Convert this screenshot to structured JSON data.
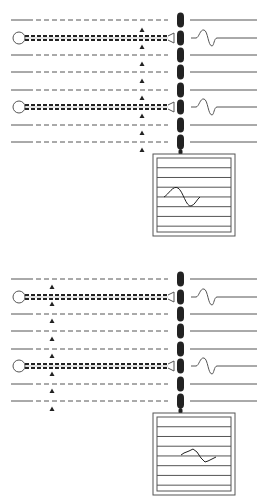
{
  "diagram": {
    "panels": [
      {
        "id": "top",
        "offset_y": 0,
        "arrow_x": 142,
        "rows": [
          {
            "y": 20,
            "type": "dashed",
            "wave": false
          },
          {
            "y": 38,
            "type": "electrode",
            "wave": true
          },
          {
            "y": 55,
            "type": "dashed",
            "wave": false
          },
          {
            "y": 72,
            "type": "dashed",
            "wave": false
          },
          {
            "y": 90,
            "type": "dashed",
            "wave": false
          },
          {
            "y": 107,
            "type": "electrode",
            "wave": true
          },
          {
            "y": 125,
            "type": "dashed",
            "wave": false
          },
          {
            "y": 142,
            "type": "dashed",
            "wave": false
          }
        ],
        "arrows_y": [
          30,
          47,
          64,
          81,
          98,
          116,
          133,
          150
        ],
        "monitor": {
          "x": 153,
          "y": 154,
          "w": 82,
          "h": 82,
          "trace": "smooth-sine"
        }
      },
      {
        "id": "bottom",
        "offset_y": 259,
        "arrow_x": 52,
        "rows": [
          {
            "y": 20,
            "type": "dashed",
            "wave": false
          },
          {
            "y": 38,
            "type": "electrode",
            "wave": true
          },
          {
            "y": 55,
            "type": "dashed",
            "wave": false
          },
          {
            "y": 72,
            "type": "dashed",
            "wave": false
          },
          {
            "y": 90,
            "type": "dashed",
            "wave": false
          },
          {
            "y": 107,
            "type": "electrode",
            "wave": true
          },
          {
            "y": 125,
            "type": "dashed",
            "wave": false
          },
          {
            "y": 142,
            "type": "dashed",
            "wave": false
          }
        ],
        "arrows_y": [
          28,
          45,
          62,
          80,
          97,
          115,
          132,
          150
        ],
        "monitor": {
          "x": 153,
          "y": 154,
          "w": 82,
          "h": 82,
          "trace": "irregular"
        }
      }
    ],
    "colors": {
      "line": "#555555",
      "dark": "#222222",
      "bg": "#ffffff"
    }
  }
}
